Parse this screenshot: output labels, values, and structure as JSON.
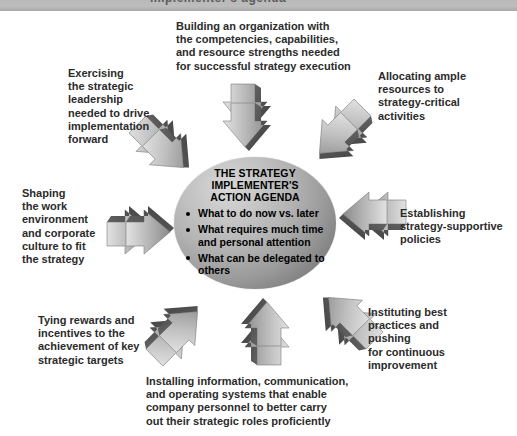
{
  "header": {
    "clipped_text": "implementer's agenda"
  },
  "center": {
    "title": "THE STRATEGY\nIMPLEMENTER'S\nACTION AGENDA",
    "bullets": [
      "What to do now vs. later",
      "What requires much time and personal attention",
      "What can be delegated to others"
    ]
  },
  "labels": [
    {
      "id": "top-center",
      "text": "Building an organization with\nthe competencies, capabilities,\nand resource strengths needed\nfor successful strategy execution"
    },
    {
      "id": "top-left",
      "text": "Exercising\nthe strategic\nleadership\nneeded to drive\nimplementation\nforward"
    },
    {
      "id": "top-right",
      "text": "Allocating ample\nresources to\nstrategy-critical\nactivities"
    },
    {
      "id": "middle-left",
      "text": "Shaping\nthe work\nenvironment\nand corporate\nculture to fit\nthe strategy"
    },
    {
      "id": "middle-right",
      "text": "Establishing\nstrategy-supportive\npolicies"
    },
    {
      "id": "bottom-left",
      "text": "Tying rewards and\nincentives to the\nachievement of key\nstrategic targets"
    },
    {
      "id": "bottom-right",
      "text": "Instituting best\npractices and\npushing\nfor continuous\nimprovement"
    },
    {
      "id": "bottom-center",
      "text": "Installing information, communication,\nand operating systems that enable\ncompany personnel to better carry\nout their strategic roles proficiently"
    }
  ],
  "arrows": [
    {
      "id": "arrow-down",
      "direction": "down"
    },
    {
      "id": "arrow-down-right",
      "direction": "down-right"
    },
    {
      "id": "arrow-down-left",
      "direction": "down-left"
    },
    {
      "id": "arrow-right",
      "direction": "right"
    },
    {
      "id": "arrow-left",
      "direction": "left"
    },
    {
      "id": "arrow-up-right",
      "direction": "up-right"
    },
    {
      "id": "arrow-up-left",
      "direction": "up-left"
    },
    {
      "id": "arrow-up",
      "direction": "up"
    }
  ],
  "colors": {
    "arrow_light": "#cfcfcf",
    "arrow_mid": "#9e9e9e",
    "arrow_dark": "#4a4a4a",
    "sphere_light": "#d8d8d8",
    "sphere_dark": "#636363",
    "text": "#2b2b2b",
    "header_bar": "#bdbdbd"
  }
}
